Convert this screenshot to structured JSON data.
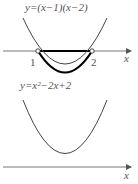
{
  "graph1": {
    "equation": "y=(x−1)(x−2)",
    "root1_label": "1",
    "root2_label": "2",
    "axis_label": "x"
  },
  "graph2": {
    "equation": "y=x²−2x+2",
    "axis_label": "x"
  },
  "colors": {
    "curve": "#333333",
    "axis": "#666666",
    "highlight": "#000000"
  }
}
